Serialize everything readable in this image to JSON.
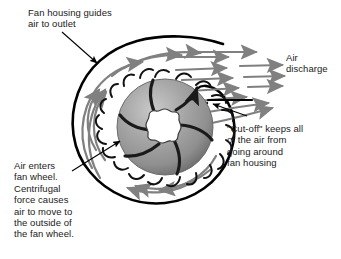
{
  "diagram": {
    "background_color": "#ffffff",
    "housing_outline_color": "#000000",
    "airflow_arrow_color": "#808080",
    "wheel_fill_color": "#999999",
    "wheel_blade_color": "#1a1a1a",
    "hub_color": "#ffffff",
    "leader_line_color": "#000000",
    "text_color": "#1a1a1a"
  },
  "labels": {
    "housing": {
      "text": "Fan housing guides\nair to outlet",
      "lines": [
        "Fan housing guides",
        "air to outlet"
      ]
    },
    "discharge": {
      "text": "Air\ndischarge",
      "lines": [
        "Air",
        "discharge"
      ]
    },
    "cutoff": {
      "text": "\"Cut-off\" keeps all\nof the air from\ngoing around\nfan housing",
      "lines": [
        "\"Cut-off\" keeps all",
        "of the air from",
        "going around",
        "fan housing"
      ]
    },
    "inlet": {
      "text": "Air enters\nfan wheel.\nCentrifugal\nforce causes\nair to move to\nthe outside of\nthe fan wheel.",
      "lines": [
        "Air enters",
        "fan wheel.",
        "Centrifugal",
        "force causes",
        "air to move to",
        "the outside of",
        "the fan wheel."
      ]
    }
  },
  "components": {
    "fan_wheel": "fan-wheel",
    "fan_housing": "fan-housing-scroll",
    "cut_off": "cut-off-point",
    "hub": "wheel-hub",
    "blade_count": 6,
    "rim_blade_count": 20
  }
}
